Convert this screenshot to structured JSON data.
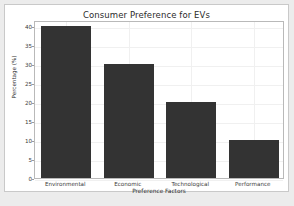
{
  "chart_data": {
    "type": "bar",
    "title": "Consumer Preference for EVs",
    "xlabel": "Preference Factors",
    "ylabel": "Percentage (%)",
    "categories": [
      "Environmental",
      "Economic",
      "Technological",
      "Performance"
    ],
    "values": [
      40,
      30,
      20,
      10
    ],
    "ylim": [
      0,
      41.5
    ],
    "yticks": [
      0,
      5,
      10,
      15,
      20,
      25,
      30,
      35,
      40
    ],
    "ytick_labels": [
      "0",
      "5",
      "10",
      "15",
      "20",
      "25",
      "30",
      "35",
      "40"
    ],
    "grid": true,
    "legend": null,
    "bar_color": "#333333",
    "plot_background": "#ffffff",
    "figure_background": "#ffffff",
    "page_background": "#ececec",
    "grid_color": "#f0f0f0",
    "axis_color": "#b9b9b9"
  }
}
